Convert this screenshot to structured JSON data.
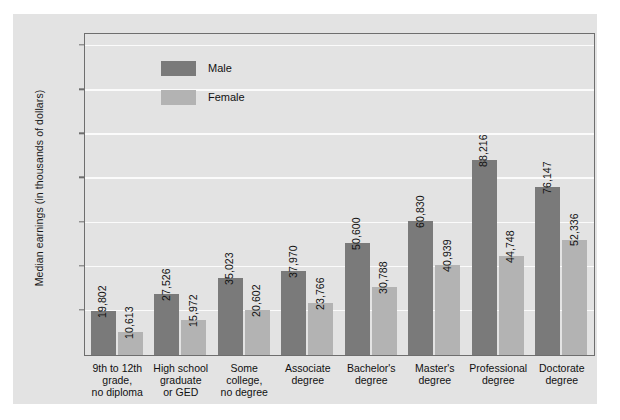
{
  "chart_data": {
    "type": "bar",
    "title": "",
    "xlabel": "",
    "ylabel": "Median earnings (in thousands of dollars)",
    "ylim": [
      0,
      145
    ],
    "yticks": [
      20,
      40,
      60,
      80,
      100,
      120,
      140
    ],
    "grid": true,
    "legend_position": "inside-top-left",
    "categories": [
      "9th to 12th\ngrade,\nno diploma",
      "High school\ngraduate\nor GED",
      "Some\ncollege,\nno degree",
      "Associate\ndegree",
      "Bachelor's\ndegree",
      "Master's\ndegree",
      "Professional\ndegree",
      "Doctorate\ndegree"
    ],
    "series": [
      {
        "name": "Male",
        "color": "#7a7a7a",
        "values": [
          19802,
          27526,
          35023,
          37970,
          50600,
          60830,
          88216,
          76147
        ],
        "labels": [
          "19,802",
          "27,526",
          "35,023",
          "37,970",
          "50,600",
          "60,830",
          "88,216",
          "76,147"
        ]
      },
      {
        "name": "Female",
        "color": "#b3b3b3",
        "values": [
          10613,
          15972,
          20602,
          23766,
          30788,
          40939,
          44748,
          52336
        ],
        "labels": [
          "10,613",
          "15,972",
          "20,602",
          "23,766",
          "30,788",
          "40,939",
          "44,748",
          "52,336"
        ]
      }
    ]
  },
  "colors": {
    "page_background": "#ffffff",
    "panel_background": "#e3e3e3",
    "gridline": "#fbfbfb",
    "axis": "#6e6e6e",
    "text": "#111111",
    "male_bar": "#7a7a7a",
    "female_bar": "#b3b3b3"
  }
}
